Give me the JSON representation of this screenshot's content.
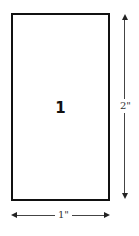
{
  "diagram": {
    "shape": "rectangle",
    "label": "1",
    "dimensions": {
      "height_label": "2\"",
      "width_label": "1\""
    },
    "colors": {
      "stroke": "#111111",
      "dimension_line": "#444444",
      "background": "#ffffff"
    }
  }
}
